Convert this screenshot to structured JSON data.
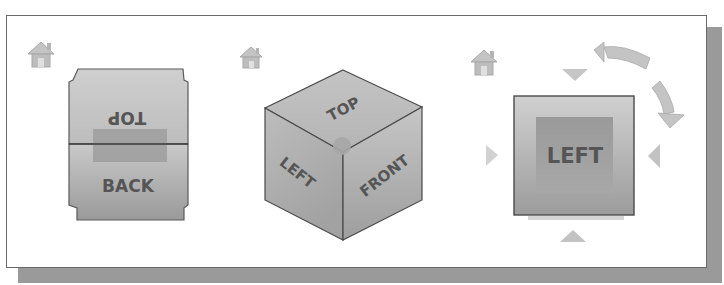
{
  "figure": {
    "panels": [
      {
        "id": "cube-back-top",
        "home_icon": "home-icon",
        "faces": {
          "upper": "TOP",
          "lower": "BACK"
        },
        "upper_label_rotated": true
      },
      {
        "id": "cube-isometric",
        "home_icon": "home-icon",
        "faces": {
          "top": "TOP",
          "left": "LEFT",
          "right": "FRONT"
        }
      },
      {
        "id": "cube-face-left",
        "home_icon": "home-icon",
        "faces": {
          "front": "LEFT"
        },
        "controls": [
          "arrow-up-icon",
          "arrow-down-icon",
          "arrow-left-icon",
          "arrow-right-icon",
          "rotate-ccw-icon",
          "rotate-cw-icon"
        ]
      }
    ]
  },
  "colors": {
    "cube_face_light": "#d4d4d4",
    "cube_face_mid": "#b8b8b8",
    "cube_face_dark": "#8e8e8e",
    "cube_edge": "#4a4a4a",
    "highlight": "#9c9c9c",
    "arrow": "#c8c8c8",
    "label": "#555555",
    "shadow": "#9a9a9a",
    "frame_border": "#6a6a6a"
  }
}
